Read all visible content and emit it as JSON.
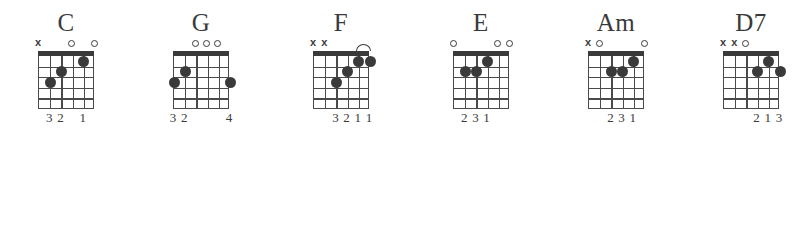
{
  "chart": {
    "string_count": 6,
    "fret_count": 5,
    "colors": {
      "ink": "#3a3a3a",
      "grid": "#4a4a4a",
      "background": "#ffffff"
    },
    "legend": {
      "open_symbol": "o",
      "muted_symbol": "x",
      "barre_symbol": "arc"
    }
  },
  "chords": [
    {
      "name": "C",
      "x": 6,
      "markers": [
        {
          "string": 6,
          "type": "x"
        },
        {
          "string": 3,
          "type": "o"
        },
        {
          "string": 1,
          "type": "o"
        }
      ],
      "dots": [
        {
          "string": 5,
          "fret": 3
        },
        {
          "string": 4,
          "fret": 2
        },
        {
          "string": 2,
          "fret": 1
        }
      ],
      "barre": null,
      "fingering": [
        {
          "string": 5,
          "finger": "3"
        },
        {
          "string": 4,
          "finger": "2"
        },
        {
          "string": 2,
          "finger": "1"
        }
      ],
      "fingering_text": "32 1"
    },
    {
      "name": "G",
      "x": 141,
      "markers": [
        {
          "string": 4,
          "type": "o"
        },
        {
          "string": 3,
          "type": "o"
        },
        {
          "string": 2,
          "type": "o"
        }
      ],
      "dots": [
        {
          "string": 6,
          "fret": 3
        },
        {
          "string": 5,
          "fret": 2
        },
        {
          "string": 1,
          "fret": 3
        }
      ],
      "barre": null,
      "fingering": [
        {
          "string": 6,
          "finger": "3"
        },
        {
          "string": 5,
          "finger": "2"
        },
        {
          "string": 1,
          "finger": "4"
        }
      ],
      "fingering_text": "32   4"
    },
    {
      "name": "F",
      "x": 281,
      "markers": [
        {
          "string": 6,
          "type": "x"
        },
        {
          "string": 5,
          "type": "x"
        }
      ],
      "dots": [
        {
          "string": 4,
          "fret": 3
        },
        {
          "string": 3,
          "fret": 2
        },
        {
          "string": 2,
          "fret": 1
        },
        {
          "string": 1,
          "fret": 1
        }
      ],
      "barre": {
        "fret": 1,
        "from_string": 2,
        "to_string": 1
      },
      "fingering": [
        {
          "string": 4,
          "finger": "3"
        },
        {
          "string": 3,
          "finger": "2"
        },
        {
          "string": 2,
          "finger": "1"
        },
        {
          "string": 1,
          "finger": "1"
        }
      ],
      "fingering_text": "3211"
    },
    {
      "name": "E",
      "x": 421,
      "markers": [
        {
          "string": 6,
          "type": "o"
        },
        {
          "string": 2,
          "type": "o"
        },
        {
          "string": 1,
          "type": "o"
        }
      ],
      "dots": [
        {
          "string": 5,
          "fret": 2
        },
        {
          "string": 4,
          "fret": 2
        },
        {
          "string": 3,
          "fret": 1
        }
      ],
      "barre": null,
      "fingering": [
        {
          "string": 5,
          "finger": "2"
        },
        {
          "string": 4,
          "finger": "3"
        },
        {
          "string": 3,
          "finger": "1"
        }
      ],
      "fingering_text": "231"
    },
    {
      "name": "Am",
      "x": 556,
      "markers": [
        {
          "string": 6,
          "type": "x"
        },
        {
          "string": 5,
          "type": "o"
        },
        {
          "string": 1,
          "type": "o"
        }
      ],
      "dots": [
        {
          "string": 4,
          "fret": 2
        },
        {
          "string": 3,
          "fret": 2
        },
        {
          "string": 2,
          "fret": 1
        }
      ],
      "barre": null,
      "fingering": [
        {
          "string": 4,
          "finger": "2"
        },
        {
          "string": 3,
          "finger": "3"
        },
        {
          "string": 2,
          "finger": "1"
        }
      ],
      "fingering_text": "231"
    },
    {
      "name": "D7",
      "x": 691,
      "markers": [
        {
          "string": 6,
          "type": "x"
        },
        {
          "string": 5,
          "type": "x"
        },
        {
          "string": 4,
          "type": "o"
        }
      ],
      "dots": [
        {
          "string": 3,
          "fret": 2
        },
        {
          "string": 2,
          "fret": 1
        },
        {
          "string": 1,
          "fret": 2
        }
      ],
      "barre": null,
      "fingering": [
        {
          "string": 3,
          "finger": "2"
        },
        {
          "string": 2,
          "finger": "1"
        },
        {
          "string": 1,
          "finger": "3"
        }
      ],
      "fingering_text": "213"
    }
  ]
}
